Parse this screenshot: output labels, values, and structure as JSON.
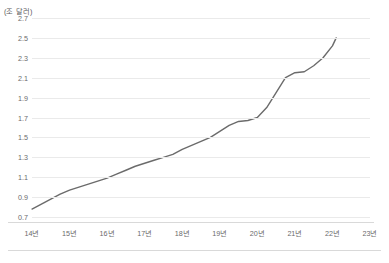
{
  "chart_data": {
    "type": "line",
    "title": "",
    "subtitle": "",
    "unit_caption": "(조 달러)",
    "xlabel": "",
    "ylabel": "",
    "grid": true,
    "legend": null,
    "ylim": [
      0.7,
      2.7
    ],
    "ytick_labels": [
      "2.7",
      "2.5",
      "2.3",
      "2.1",
      "1.9",
      "1.7",
      "1.5",
      "1.3",
      "1.1",
      "0.9",
      "0.7"
    ],
    "ytick_values": [
      2.7,
      2.5,
      2.3,
      2.1,
      1.9,
      1.7,
      1.5,
      1.3,
      1.1,
      0.9,
      0.7
    ],
    "categories": [
      "14년",
      "15년",
      "16년",
      "17년",
      "18년",
      "19년",
      "20년",
      "21년",
      "22년",
      "23년"
    ],
    "xlim": [
      2014.0,
      2023.0
    ],
    "series": [
      {
        "name": "",
        "color": "#6b6b6b",
        "x": [
          2014.0,
          2014.25,
          2014.5,
          2014.75,
          2015.0,
          2015.25,
          2015.5,
          2015.75,
          2016.0,
          2016.25,
          2016.5,
          2016.75,
          2017.0,
          2017.25,
          2017.5,
          2017.75,
          2018.0,
          2018.25,
          2018.5,
          2018.75,
          2019.0,
          2019.25,
          2019.5,
          2019.75,
          2020.0,
          2020.25,
          2020.5,
          2020.75,
          2021.0,
          2021.25,
          2021.5,
          2021.75,
          2022.0,
          2022.1
        ],
        "values": [
          0.78,
          0.83,
          0.88,
          0.93,
          0.97,
          1.0,
          1.03,
          1.06,
          1.09,
          1.13,
          1.17,
          1.21,
          1.24,
          1.27,
          1.3,
          1.33,
          1.38,
          1.42,
          1.46,
          1.5,
          1.56,
          1.62,
          1.66,
          1.67,
          1.7,
          1.8,
          1.95,
          2.1,
          2.15,
          2.16,
          2.22,
          2.3,
          2.42,
          2.5
        ]
      }
    ],
    "footer_note": ""
  }
}
